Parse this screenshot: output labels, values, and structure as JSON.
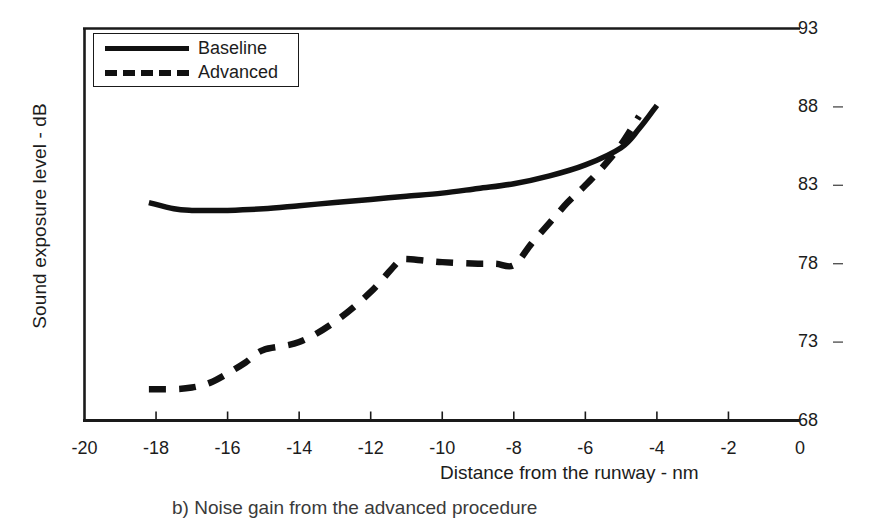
{
  "chart_data": {
    "type": "line",
    "title": "",
    "caption": "b) Noise gain from the advanced procedure",
    "xlabel": "Distance from the runway - nm",
    "ylabel": "Sound exposure level - dB",
    "xlim": [
      -20,
      0
    ],
    "ylim": [
      68,
      93
    ],
    "xticks": [
      -20,
      -18,
      -16,
      -14,
      -12,
      -10,
      -8,
      -6,
      -4,
      -2,
      0
    ],
    "yticks": [
      68,
      73,
      78,
      83,
      88,
      93
    ],
    "xtick_labels": [
      "-20",
      "-18",
      "-16",
      "-14",
      "-12",
      "-10",
      "-8",
      "-6",
      "-4",
      "-2",
      "0"
    ],
    "ytick_labels": [
      "68",
      "73",
      "78",
      "83",
      "88",
      "93"
    ],
    "y_axis_side": "right",
    "grid": false,
    "legend_position": "top-left",
    "series": [
      {
        "name": "Baseline",
        "style": "solid",
        "color": "#111111",
        "x": [
          -18.2,
          -17.5,
          -17.0,
          -16.5,
          -16.0,
          -15.0,
          -14.0,
          -13.0,
          -12.0,
          -11.0,
          -10.0,
          -9.0,
          -8.0,
          -7.0,
          -6.0,
          -5.0,
          -4.5,
          -4.0
        ],
        "y": [
          81.9,
          81.5,
          81.4,
          81.4,
          81.4,
          81.5,
          81.7,
          81.9,
          82.1,
          82.3,
          82.5,
          82.8,
          83.1,
          83.6,
          84.3,
          85.4,
          86.6,
          88.1
        ]
      },
      {
        "name": "Advanced",
        "style": "dashed",
        "color": "#111111",
        "x": [
          -18.2,
          -17.5,
          -17.0,
          -16.5,
          -16.0,
          -15.5,
          -15.0,
          -14.0,
          -13.0,
          -12.0,
          -11.2,
          -11.0,
          -10.5,
          -10.0,
          -9.0,
          -8.5,
          -8.0,
          -7.5,
          -7.0,
          -6.5,
          -6.0,
          -5.5,
          -5.0,
          -4.5
        ],
        "y": [
          70.0,
          70.0,
          70.1,
          70.4,
          71.0,
          71.7,
          72.5,
          73.0,
          74.3,
          76.2,
          78.2,
          78.3,
          78.2,
          78.1,
          78.0,
          78.0,
          77.9,
          79.3,
          80.6,
          81.9,
          83.0,
          84.2,
          85.6,
          87.4
        ]
      }
    ]
  },
  "legend": {
    "entries": [
      {
        "label": "Baseline",
        "style": "solid"
      },
      {
        "label": "Advanced",
        "style": "dashed"
      }
    ]
  }
}
